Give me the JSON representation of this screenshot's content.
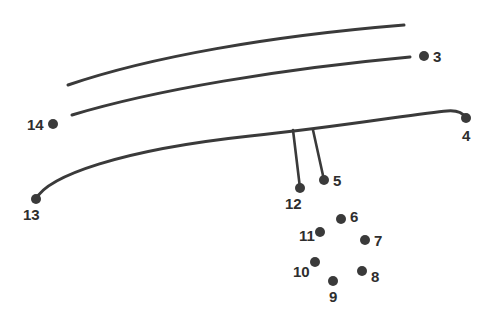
{
  "figure": {
    "type": "technical-line-drawing",
    "canvas": {
      "width": 499,
      "height": 320
    },
    "background_color": "#ffffff",
    "ink_color": "#3a3a3a",
    "label_color": "#2e2e2e",
    "stroke_width": 3,
    "dot_radius": 5,
    "curves": [
      {
        "name": "upper-curve",
        "path": "M 68 85 C 150 57, 270 36, 404 25",
        "start": [
          68,
          85
        ],
        "end": [
          404,
          25
        ]
      },
      {
        "name": "middle-curve",
        "path": "M 72 115 C 155 90, 280 69, 410 57",
        "start": [
          72,
          115
        ],
        "end": [
          410,
          57
        ]
      },
      {
        "name": "lower-curve",
        "path": "M 36 199 C 48 176, 120 150, 250 136 C 340 127, 420 113, 447 111 C 458 110, 463 113, 466 118",
        "start": [
          36,
          199
        ],
        "end": [
          466,
          118
        ]
      }
    ],
    "leader_lines": [
      {
        "name": "leader-to-12",
        "from": [
          293,
          130
        ],
        "to": [
          300,
          188
        ]
      },
      {
        "name": "leader-to-5",
        "from": [
          313,
          130
        ],
        "to": [
          324,
          180
        ]
      }
    ],
    "reference_points": [
      {
        "id": "3",
        "dot": [
          424,
          56
        ],
        "label": "3",
        "label_x": 433,
        "label_y": 49,
        "label_align": "left"
      },
      {
        "id": "4",
        "dot": [
          466,
          118
        ],
        "label": "4",
        "label_x": 462,
        "label_y": 128,
        "label_align": "left"
      },
      {
        "id": "5",
        "dot": [
          324,
          180
        ],
        "label": "5",
        "label_x": 333,
        "label_y": 173,
        "label_align": "left"
      },
      {
        "id": "6",
        "dot": [
          341,
          219
        ],
        "label": "6",
        "label_x": 350,
        "label_y": 209,
        "label_align": "left"
      },
      {
        "id": "7",
        "dot": [
          365,
          240
        ],
        "label": "7",
        "label_x": 374,
        "label_y": 233,
        "label_align": "left"
      },
      {
        "id": "8",
        "dot": [
          362,
          271
        ],
        "label": "8",
        "label_x": 371,
        "label_y": 269,
        "label_align": "left"
      },
      {
        "id": "9",
        "dot": [
          333,
          281
        ],
        "label": "9",
        "label_x": 329,
        "label_y": 289,
        "label_align": "left"
      },
      {
        "id": "10",
        "dot": [
          315,
          262
        ],
        "label": "10",
        "label_x": 293,
        "label_y": 264,
        "label_align": "left"
      },
      {
        "id": "11",
        "dot": [
          320,
          232
        ],
        "label": "11",
        "label_x": 299,
        "label_y": 228,
        "label_align": "left"
      },
      {
        "id": "12",
        "dot": [
          300,
          188
        ],
        "label": "12",
        "label_x": 285,
        "label_y": 196,
        "label_align": "left"
      },
      {
        "id": "13",
        "dot": [
          36,
          199
        ],
        "label": "13",
        "label_x": 23,
        "label_y": 207,
        "label_align": "left"
      },
      {
        "id": "14",
        "dot": [
          53,
          124
        ],
        "label": "14",
        "label_x": 27,
        "label_y": 117,
        "label_align": "left"
      }
    ]
  }
}
